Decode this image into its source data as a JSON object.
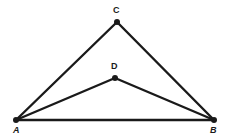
{
  "figure": {
    "background_color": "#ffffff",
    "stroke_color": "#1a1a1a",
    "label_color": "#1a1a1a",
    "canvas": {
      "width": 233,
      "height": 139
    },
    "points": [
      {
        "id": "A",
        "label": "A",
        "x": 16,
        "y": 120,
        "label_x": 13,
        "label_y": 126,
        "label_style": "italic",
        "dot_radius": 3
      },
      {
        "id": "B",
        "label": "B",
        "x": 214,
        "y": 120,
        "label_x": 210,
        "label_y": 126,
        "label_style": "italic",
        "dot_radius": 3
      },
      {
        "id": "C",
        "label": "C",
        "x": 117,
        "y": 22,
        "label_x": 113,
        "label_y": 6,
        "label_style": "normal",
        "dot_radius": 3
      },
      {
        "id": "D",
        "label": "D",
        "x": 115,
        "y": 78,
        "label_x": 111,
        "label_y": 62,
        "label_style": "normal",
        "dot_radius": 3
      }
    ],
    "segments": [
      {
        "id": "AB",
        "from": "A",
        "to": "B",
        "x1": 16,
        "y1": 120,
        "x2": 214,
        "y2": 120,
        "width": 2.4
      },
      {
        "id": "AC",
        "from": "A",
        "to": "C",
        "x1": 16,
        "y1": 120,
        "x2": 117,
        "y2": 22,
        "width": 2.4
      },
      {
        "id": "CB",
        "from": "C",
        "to": "B",
        "x1": 117,
        "y1": 22,
        "x2": 214,
        "y2": 120,
        "width": 2.4
      },
      {
        "id": "AD",
        "from": "A",
        "to": "D",
        "x1": 16,
        "y1": 120,
        "x2": 115,
        "y2": 78,
        "width": 2.4
      },
      {
        "id": "DB",
        "from": "D",
        "to": "B",
        "x1": 115,
        "y1": 78,
        "x2": 214,
        "y2": 120,
        "width": 2.4
      }
    ]
  }
}
